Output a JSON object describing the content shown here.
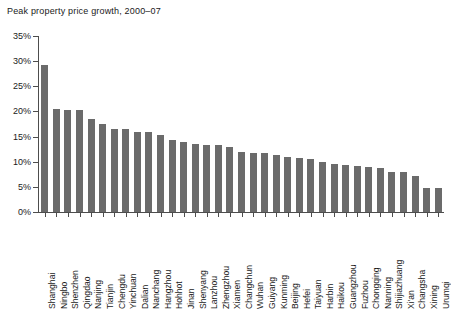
{
  "chart_data": {
    "type": "bar",
    "title": "Peak property price growth, 2000–07",
    "xlabel": "",
    "ylabel": "",
    "ylim": [
      0,
      35
    ],
    "ytick_values": [
      0,
      5,
      10,
      15,
      20,
      25,
      30,
      35
    ],
    "ytick_labels": [
      "0%",
      "5%",
      "10%",
      "15%",
      "20%",
      "25%",
      "30%",
      "35%"
    ],
    "grid": false,
    "legend": false,
    "bar_color": "#6b6b6b",
    "axis_color": "#4d4d4d",
    "categories": [
      "Shanghai",
      "Ningbo",
      "Shenzhen",
      "Qingdao",
      "Nanjing",
      "Tianjin",
      "Chengdu",
      "Yinchuan",
      "Dalian",
      "Nanchang",
      "Hangzhou",
      "Hohhot",
      "Jinan",
      "Shenyang",
      "Lanzhou",
      "Zhengzhou",
      "Xiamen",
      "Changchun",
      "Wuhan",
      "Guiyang",
      "Kunming",
      "Beijing",
      "Hefei",
      "Taiyuan",
      "Harbin",
      "Haikou",
      "Guangzhou",
      "Fuzhou",
      "Chongqing",
      "Nanning",
      "Shijiazhuang",
      "Xi'an",
      "Changsha",
      "Xining",
      "Urumqi"
    ],
    "values": [
      29.3,
      20.5,
      20.2,
      20.2,
      18.5,
      17.5,
      16.6,
      16.6,
      15.9,
      15.9,
      15.3,
      14.4,
      14.0,
      13.5,
      13.3,
      13.3,
      12.9,
      12.0,
      11.8,
      11.8,
      11.4,
      10.9,
      10.7,
      10.6,
      10.0,
      9.5,
      9.3,
      9.2,
      8.9,
      8.7,
      8.0,
      7.9,
      7.1,
      4.8,
      4.7
    ]
  }
}
